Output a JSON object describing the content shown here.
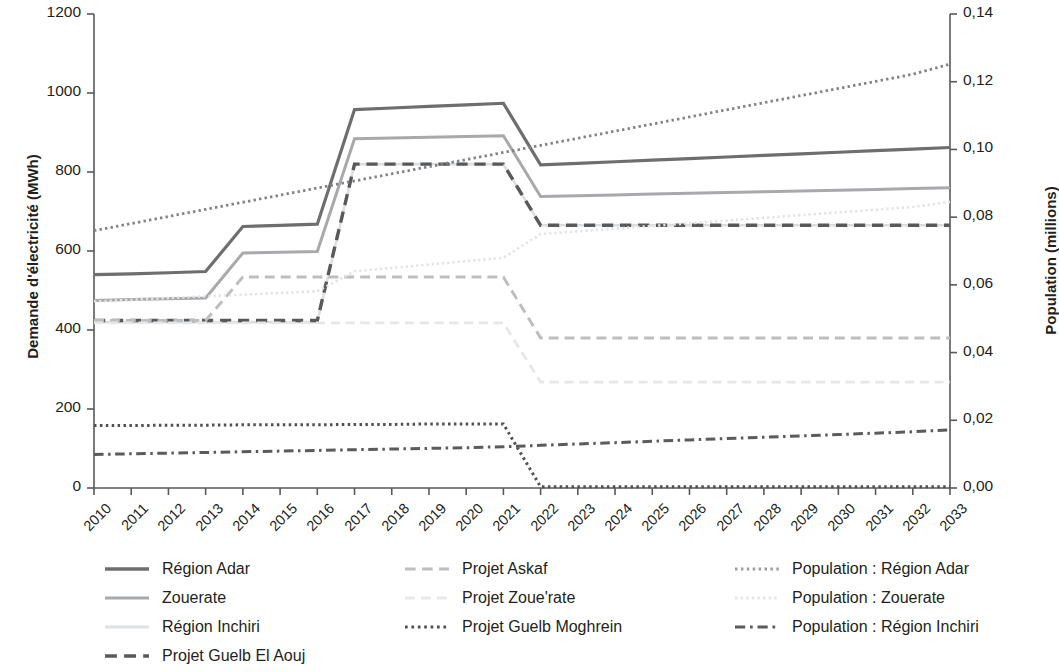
{
  "chart_data": {
    "type": "line",
    "title": "",
    "xlabel": "",
    "ylabel": "Demande d'électricité (MWh)",
    "y2label": "Population (millions)",
    "grid": false,
    "legend_position": "bottom",
    "x": [
      2010,
      2011,
      2012,
      2013,
      2014,
      2015,
      2016,
      2017,
      2018,
      2019,
      2020,
      2021,
      2022,
      2023,
      2024,
      2025,
      2026,
      2027,
      2028,
      2029,
      2030,
      2031,
      2032,
      2033
    ],
    "xtick_labels": [
      "2010",
      "2011",
      "2012",
      "2013",
      "2014",
      "2015",
      "2016",
      "2017",
      "2018",
      "2019",
      "2020",
      "2021",
      "2022",
      "2023",
      "2024",
      "2025",
      "2026",
      "2027",
      "2028",
      "2029",
      "2030",
      "2031",
      "2032",
      "2033"
    ],
    "ylim": [
      0,
      1200
    ],
    "ytick_labels": [
      "0",
      "200",
      "400",
      "600",
      "800",
      "1000",
      "1200"
    ],
    "ytick_values": [
      0,
      200,
      400,
      600,
      800,
      1000,
      1200
    ],
    "y2lim": [
      0,
      0.14
    ],
    "y2tick_labels": [
      "0,00",
      "0,02",
      "0,04",
      "0,06",
      "0,08",
      "0,10",
      "0,12",
      "0,14"
    ],
    "y2tick_values": [
      0,
      0.02,
      0.04,
      0.06,
      0.08,
      0.1,
      0.12,
      0.14
    ],
    "series": [
      {
        "name": "Région Adar",
        "axis": "left",
        "color": "#6d6e70",
        "width": 3.2,
        "dash": "solid",
        "values": [
          540,
          542,
          545,
          548,
          662,
          665,
          668,
          958,
          962,
          966,
          970,
          974,
          818,
          822,
          826,
          830,
          834,
          838,
          842,
          846,
          850,
          854,
          858,
          862
        ]
      },
      {
        "name": "Zouerate",
        "axis": "left",
        "color": "#a7a9ac",
        "width": 3.0,
        "dash": "solid",
        "values": [
          475,
          477,
          479,
          481,
          595,
          597,
          599,
          884,
          886,
          888,
          890,
          892,
          738,
          740,
          742,
          744,
          746,
          748,
          750,
          752,
          754,
          756,
          758,
          760
        ]
      },
      {
        "name": "Région Inchiri",
        "axis": "left",
        "color": "#dcdddf",
        "width": 2.6,
        "dash": "solid",
        "values": [
          420,
          420,
          420,
          420,
          420,
          420,
          420,
          820,
          820,
          820,
          820,
          820,
          665,
          665,
          665,
          665,
          665,
          665,
          665,
          665,
          665,
          665,
          665,
          665
        ]
      },
      {
        "name": "Projet Guelb El Aouj",
        "axis": "left",
        "color": "#58595b",
        "width": 3.4,
        "dash": "dashed",
        "values": [
          424,
          424,
          424,
          424,
          424,
          424,
          424,
          820,
          820,
          820,
          820,
          820,
          665,
          665,
          665,
          665,
          665,
          665,
          665,
          665,
          665,
          665,
          665,
          665
        ]
      },
      {
        "name": "Projet Askaf",
        "axis": "left",
        "color": "#bcbec0",
        "width": 3.0,
        "dash": "dashed",
        "values": [
          424,
          424,
          424,
          424,
          534,
          534,
          534,
          534,
          534,
          534,
          534,
          534,
          380,
          380,
          380,
          380,
          380,
          380,
          380,
          380,
          380,
          380,
          380,
          380
        ]
      },
      {
        "name": "Projet Zoue'rate",
        "axis": "left",
        "color": "#e6e7e8",
        "width": 2.8,
        "dash": "dashed",
        "values": [
          418,
          418,
          418,
          418,
          418,
          418,
          418,
          418,
          418,
          418,
          418,
          418,
          268,
          268,
          268,
          268,
          268,
          268,
          268,
          268,
          268,
          268,
          268,
          268
        ]
      },
      {
        "name": "Projet Guelb Moghrein",
        "axis": "left",
        "color": "#4f5052",
        "width": 3.0,
        "dash": "dotted",
        "values": [
          158,
          158,
          159,
          159,
          160,
          160,
          160,
          161,
          161,
          162,
          162,
          162,
          3,
          3,
          3,
          3,
          3,
          3,
          3,
          3,
          3,
          3,
          3,
          3
        ]
      },
      {
        "name": "Population : Région Adar",
        "axis": "right",
        "color": "#808285",
        "width": 2.8,
        "dash": "dotted",
        "values": [
          0.076,
          0.0781,
          0.0802,
          0.0823,
          0.0844,
          0.0865,
          0.0886,
          0.0907,
          0.0928,
          0.0949,
          0.097,
          0.0991,
          0.1012,
          0.1033,
          0.1054,
          0.1075,
          0.1096,
          0.1117,
          0.1138,
          0.1159,
          0.118,
          0.1201,
          0.1222,
          0.1252
        ]
      },
      {
        "name": "Population : Zouerate",
        "axis": "right",
        "color": "#e2e3e5",
        "width": 2.6,
        "dash": "dotted",
        "values": [
          0.0551,
          0.0556,
          0.0561,
          0.0566,
          0.0571,
          0.0576,
          0.0581,
          0.064,
          0.065,
          0.066,
          0.067,
          0.068,
          0.075,
          0.0758,
          0.0766,
          0.0774,
          0.0782,
          0.079,
          0.0798,
          0.0806,
          0.0814,
          0.0822,
          0.083,
          0.0845
        ]
      },
      {
        "name": "Population : Région Inchiri",
        "axis": "right",
        "color": "#5a5b5d",
        "width": 3.0,
        "dash": "dashdot",
        "values": [
          0.0099,
          0.0101,
          0.0103,
          0.0105,
          0.0107,
          0.0109,
          0.0111,
          0.0113,
          0.0115,
          0.0117,
          0.0119,
          0.0122,
          0.0126,
          0.013,
          0.0134,
          0.0138,
          0.0142,
          0.0146,
          0.015,
          0.0154,
          0.0158,
          0.0162,
          0.0166,
          0.0172
        ]
      }
    ]
  },
  "legend": {
    "items": [
      {
        "label": "Région Adar",
        "color": "#6d6e70",
        "dash": "solid",
        "width": 3.4,
        "col": 0,
        "row": 0
      },
      {
        "label": "Zouerate",
        "color": "#a7a9ac",
        "dash": "solid",
        "width": 3.2,
        "col": 0,
        "row": 1
      },
      {
        "label": "Région Inchiri",
        "color": "#e0e1e3",
        "dash": "solid",
        "width": 3.0,
        "col": 0,
        "row": 2
      },
      {
        "label": "Projet Guelb El Aouj",
        "color": "#58595b",
        "dash": "dashed",
        "width": 3.6,
        "col": 0,
        "row": 3
      },
      {
        "label": "Projet Askaf",
        "color": "#bcbec0",
        "dash": "dashed",
        "width": 3.2,
        "col": 1,
        "row": 0
      },
      {
        "label": "Projet Zoue'rate",
        "color": "#e8e9ea",
        "dash": "dashed",
        "width": 3.0,
        "col": 1,
        "row": 1
      },
      {
        "label": "Projet Guelb Moghrein",
        "color": "#4f5052",
        "dash": "dotted",
        "width": 3.2,
        "col": 1,
        "row": 2
      },
      {
        "label": "Population : Région Adar",
        "color": "#9a9c9e",
        "dash": "dotted",
        "width": 3.0,
        "col": 2,
        "row": 0
      },
      {
        "label": "Population : Zouerate",
        "color": "#e4e5e7",
        "dash": "dotted",
        "width": 2.8,
        "col": 2,
        "row": 1
      },
      {
        "label": "Population : Région Inchiri",
        "color": "#5a5b5d",
        "dash": "dashdot",
        "width": 3.2,
        "col": 2,
        "row": 2
      }
    ]
  },
  "axes": {
    "left_title": "Demande d'électricité (MWh)",
    "right_title": "Population (millions)"
  }
}
